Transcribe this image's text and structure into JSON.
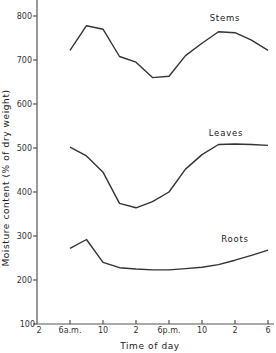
{
  "chart_data": {
    "type": "line",
    "title": "",
    "xlabel": "Time of day",
    "ylabel": "Moisture content (% of dry weight)",
    "ylim": [
      100,
      850
    ],
    "y_ticks": [
      100,
      200,
      300,
      400,
      500,
      600,
      700,
      800
    ],
    "x_tick_labels": [
      "2",
      "6a.m.",
      "10",
      "2",
      "6p.m.",
      "10",
      "2",
      "6"
    ],
    "x_hours_from_2am": [
      0,
      4,
      8,
      12,
      16,
      20,
      24,
      28
    ],
    "grid": false,
    "legend": "inline labels",
    "x": [
      4,
      6,
      8,
      10,
      12,
      14,
      16,
      18,
      20,
      22,
      24,
      26,
      28
    ],
    "x_labels": [
      "6a.m.",
      "8",
      "10",
      "12",
      "2",
      "4",
      "6p.m.",
      "8",
      "10",
      "12",
      "2",
      "4",
      "6"
    ],
    "series": [
      {
        "name": "Stems",
        "values": [
          722,
          778,
          770,
          708,
          695,
          660,
          663,
          710,
          738,
          764,
          762,
          745,
          722
        ]
      },
      {
        "name": "Leaves",
        "values": [
          502,
          482,
          445,
          374,
          364,
          378,
          400,
          452,
          485,
          508,
          509,
          508,
          506
        ]
      },
      {
        "name": "Roots",
        "values": [
          272,
          292,
          240,
          228,
          225,
          223,
          223,
          226,
          229,
          235,
          245,
          256,
          268
        ]
      }
    ]
  },
  "labels": {
    "xlabel": "Time of day",
    "ylabel": "Moisture content (% of dry weight)",
    "stems": "Stems",
    "leaves": "Leaves",
    "roots": "Roots"
  }
}
